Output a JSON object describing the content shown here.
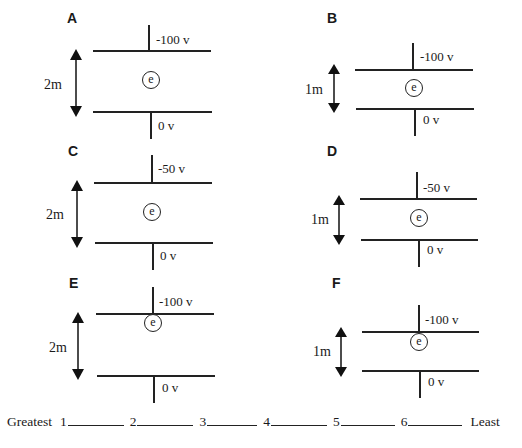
{
  "panels": [
    {
      "id": "A",
      "label": "A",
      "top_voltage": "-100 v",
      "bottom_voltage": "0 v",
      "separation": "2m",
      "electron": "e",
      "electron_position": "middle"
    },
    {
      "id": "B",
      "label": "B",
      "top_voltage": "-100 v",
      "bottom_voltage": "0 v",
      "separation": "1m",
      "electron": "e",
      "electron_position": "middle"
    },
    {
      "id": "C",
      "label": "C",
      "top_voltage": "-50 v",
      "bottom_voltage": "0 v",
      "separation": "2m",
      "electron": "e",
      "electron_position": "middle"
    },
    {
      "id": "D",
      "label": "D",
      "top_voltage": "-50 v",
      "bottom_voltage": "0 v",
      "separation": "1m",
      "electron": "e",
      "electron_position": "middle"
    },
    {
      "id": "E",
      "label": "E",
      "top_voltage": "-100 v",
      "bottom_voltage": "0 v",
      "separation": "2m",
      "electron": "e",
      "electron_position": "near top plate"
    },
    {
      "id": "F",
      "label": "F",
      "top_voltage": "-100 v",
      "bottom_voltage": "0 v",
      "separation": "1m",
      "electron": "e",
      "electron_position": "near top plate"
    }
  ],
  "ranking": {
    "start_label": "Greatest",
    "end_label": "Least",
    "slots": [
      "1",
      "2",
      "3",
      "4",
      "5",
      "6"
    ]
  },
  "colors": {
    "ink": "#222222",
    "background": "#ffffff"
  }
}
